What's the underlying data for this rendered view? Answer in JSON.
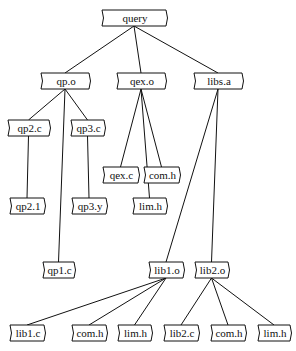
{
  "diagram": {
    "type": "dependency-tree",
    "nodes": [
      {
        "id": "query",
        "label": "query",
        "x": 102,
        "y": 10,
        "w": 64,
        "h": 16
      },
      {
        "id": "qp_o",
        "label": "qp.o",
        "x": 41,
        "y": 73,
        "w": 48,
        "h": 16
      },
      {
        "id": "qex_o",
        "label": "qex.o",
        "x": 117,
        "y": 73,
        "w": 48,
        "h": 16
      },
      {
        "id": "libs_a",
        "label": "libs.a",
        "x": 194,
        "y": 73,
        "w": 48,
        "h": 16
      },
      {
        "id": "qp2_c",
        "label": "qp2.c",
        "x": 8,
        "y": 120,
        "w": 41,
        "h": 16
      },
      {
        "id": "qp3_c",
        "label": "qp3.c",
        "x": 71,
        "y": 120,
        "w": 33,
        "h": 16
      },
      {
        "id": "qex_c",
        "label": "qex.c",
        "x": 103,
        "y": 167,
        "w": 35,
        "h": 16
      },
      {
        "id": "com_h1",
        "label": "com.h",
        "x": 144,
        "y": 167,
        "w": 35,
        "h": 16
      },
      {
        "id": "qp2_1",
        "label": "qp2.1",
        "x": 10,
        "y": 198,
        "w": 34,
        "h": 16
      },
      {
        "id": "qp3_y",
        "label": "qp3.y",
        "x": 72,
        "y": 198,
        "w": 34,
        "h": 16
      },
      {
        "id": "lim_h1",
        "label": "lim.h",
        "x": 133,
        "y": 198,
        "w": 33,
        "h": 16
      },
      {
        "id": "qp1_c",
        "label": "qp1.c",
        "x": 43,
        "y": 262,
        "w": 31,
        "h": 16
      },
      {
        "id": "lib1_o",
        "label": "lib1.o",
        "x": 149,
        "y": 262,
        "w": 34,
        "h": 16
      },
      {
        "id": "lib2_o",
        "label": "lib2.o",
        "x": 195,
        "y": 262,
        "w": 33,
        "h": 16
      },
      {
        "id": "lib1_c",
        "label": "lib1.c",
        "x": 10,
        "y": 325,
        "w": 34,
        "h": 16
      },
      {
        "id": "com_h2",
        "label": "com.h",
        "x": 72,
        "y": 325,
        "w": 34,
        "h": 16
      },
      {
        "id": "lim_h2",
        "label": "lim.h",
        "x": 118,
        "y": 325,
        "w": 33,
        "h": 16
      },
      {
        "id": "lib2_c",
        "label": "lib2.c",
        "x": 164,
        "y": 325,
        "w": 34,
        "h": 16
      },
      {
        "id": "com_h3",
        "label": "com.h",
        "x": 211,
        "y": 325,
        "w": 34,
        "h": 16
      },
      {
        "id": "lim_h3",
        "label": "lim.h",
        "x": 258,
        "y": 325,
        "w": 32,
        "h": 16
      }
    ],
    "edges": [
      [
        "query",
        "qp_o"
      ],
      [
        "query",
        "qex_o"
      ],
      [
        "query",
        "libs_a"
      ],
      [
        "qp_o",
        "qp2_c"
      ],
      [
        "qp_o",
        "qp3_c"
      ],
      [
        "qp_o",
        "qp1_c"
      ],
      [
        "qex_o",
        "qex_c"
      ],
      [
        "qex_o",
        "com_h1"
      ],
      [
        "qex_o",
        "lim_h1"
      ],
      [
        "libs_a",
        "lib1_o"
      ],
      [
        "libs_a",
        "lib2_o"
      ],
      [
        "qp2_c",
        "qp2_1"
      ],
      [
        "qp3_c",
        "qp3_y"
      ],
      [
        "lib1_o",
        "lib1_c"
      ],
      [
        "lib1_o",
        "com_h2"
      ],
      [
        "lib1_o",
        "lim_h2"
      ],
      [
        "lib2_o",
        "lib2_c"
      ],
      [
        "lib2_o",
        "com_h3"
      ],
      [
        "lib2_o",
        "lim_h3"
      ]
    ]
  }
}
